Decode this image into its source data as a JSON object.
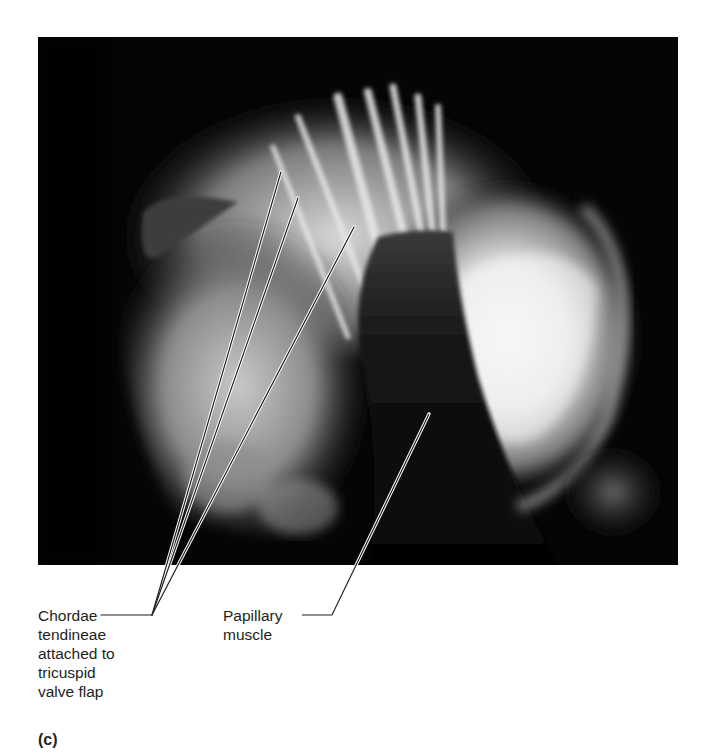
{
  "figure": {
    "panel_letter": "(c)",
    "photo": {
      "description": "Interior of right ventricle showing chordae tendineae and papillary muscle",
      "background_color": "#050505",
      "highlight_color": "#f2f2f2"
    },
    "labels": [
      {
        "id": "chordae-tendineae",
        "lines": [
          "Chordae",
          "tendineae",
          "attached to",
          "tricuspid",
          "valve flap"
        ],
        "leader_lines": 3
      },
      {
        "id": "papillary-muscle",
        "lines": [
          "Papillary",
          "muscle"
        ],
        "leader_lines": 1
      }
    ],
    "leader_line_color": "#231f20"
  }
}
